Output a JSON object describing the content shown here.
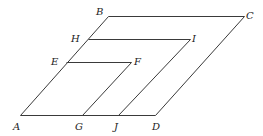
{
  "diagram": {
    "type": "geometric-parallelogram-construction",
    "colors": {
      "stroke": "#3a3a3a",
      "label": "#222222",
      "background": "#ffffff"
    },
    "points": {
      "A": {
        "label": "A",
        "x": 20,
        "y": 115,
        "lx": 13,
        "ly": 122
      },
      "B": {
        "label": "B",
        "x": 108,
        "y": 16,
        "lx": 96,
        "ly": 7
      },
      "C": {
        "label": "C",
        "x": 244,
        "y": 16,
        "lx": 246,
        "ly": 11
      },
      "D": {
        "label": "D",
        "x": 155,
        "y": 115,
        "lx": 152,
        "ly": 122
      },
      "E": {
        "label": "E",
        "x": 66,
        "y": 62,
        "lx": 51,
        "ly": 57
      },
      "F": {
        "label": "F",
        "x": 131,
        "y": 62,
        "lx": 134,
        "ly": 57
      },
      "G": {
        "label": "G",
        "x": 82,
        "y": 115,
        "lx": 75,
        "ly": 122
      },
      "H": {
        "label": "H",
        "x": 88,
        "y": 39,
        "lx": 71,
        "ly": 34
      },
      "I": {
        "label": "I",
        "x": 190,
        "y": 39,
        "lx": 192,
        "ly": 34
      },
      "J": {
        "label": "J",
        "x": 118,
        "y": 115,
        "lx": 114,
        "ly": 122
      }
    },
    "segments": [
      {
        "name": "segment-AB",
        "from": "A",
        "to": "B"
      },
      {
        "name": "segment-BC",
        "from": "B",
        "to": "C"
      },
      {
        "name": "segment-CD",
        "from": "C",
        "to": "D"
      },
      {
        "name": "segment-AD",
        "from": "A",
        "to": "D"
      },
      {
        "name": "segment-HI",
        "from": "H",
        "to": "I"
      },
      {
        "name": "segment-IJ",
        "from": "I",
        "to": "J"
      },
      {
        "name": "segment-EF",
        "from": "E",
        "to": "F"
      },
      {
        "name": "segment-FG",
        "from": "F",
        "to": "G"
      }
    ]
  }
}
